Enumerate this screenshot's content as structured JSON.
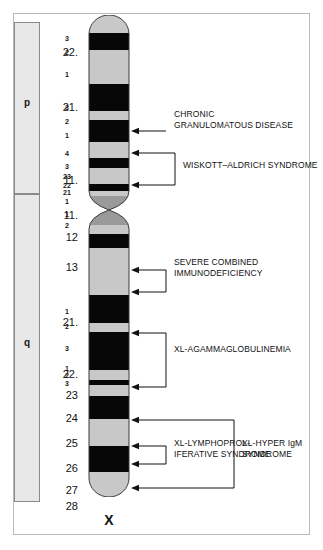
{
  "figure": {
    "chromosome_name": "X",
    "arms": [
      {
        "id": "p",
        "label": "p"
      },
      {
        "id": "q",
        "label": "q"
      }
    ]
  },
  "chart_data": {
    "type": "ideogram",
    "title": "",
    "chromosome": "X",
    "xlabel": "",
    "ylabel": "",
    "legend": [],
    "regions": [
      {
        "label": "22.",
        "arm": "p",
        "y": 53
      },
      {
        "label": "21.",
        "arm": "p",
        "y": 108
      },
      {
        "label": "11.",
        "arm": "p",
        "y": 181
      },
      {
        "label": "11.",
        "arm": "q",
        "y": 216
      },
      {
        "label": "12",
        "arm": "q",
        "y": 238
      },
      {
        "label": "13",
        "arm": "q",
        "y": 268
      },
      {
        "label": "21.",
        "arm": "q",
        "y": 323
      },
      {
        "label": "22.",
        "arm": "q",
        "y": 375
      },
      {
        "label": "23",
        "arm": "q",
        "y": 396
      },
      {
        "label": "24",
        "arm": "q",
        "y": 419
      },
      {
        "label": "25",
        "arm": "q",
        "y": 444
      },
      {
        "label": "26",
        "arm": "q",
        "y": 469
      },
      {
        "label": "27",
        "arm": "q",
        "y": 491
      },
      {
        "label": "28",
        "arm": "q",
        "y": 507
      }
    ],
    "subbands": [
      {
        "label": "3",
        "y": 39
      },
      {
        "label": "2",
        "y": 53
      },
      {
        "label": "1",
        "y": 75
      },
      {
        "label": "3",
        "y": 108
      },
      {
        "label": "2",
        "y": 122
      },
      {
        "label": "1",
        "y": 136
      },
      {
        "label": "4",
        "y": 154
      },
      {
        "label": "3",
        "y": 167
      },
      {
        "label": "23",
        "y": 177
      },
      {
        "label": "22",
        "y": 186
      },
      {
        "label": "21",
        "y": 193
      },
      {
        "label": "1",
        "y": 202
      },
      {
        "label": "1",
        "y": 215
      },
      {
        "label": "2",
        "y": 226
      },
      {
        "label": "1",
        "y": 312
      },
      {
        "label": "2",
        "y": 327
      },
      {
        "label": "3",
        "y": 349
      },
      {
        "label": "1",
        "y": 369
      },
      {
        "label": "2",
        "y": 376
      },
      {
        "label": "3",
        "y": 384
      }
    ],
    "bands": [
      {
        "id": "p22.3",
        "top": 0,
        "height": 18,
        "stain": "gneg",
        "color": "#c8c8c8"
      },
      {
        "id": "p22.2",
        "top": 18,
        "height": 17,
        "stain": "gpos",
        "color": "#070707"
      },
      {
        "id": "p22.1",
        "top": 35,
        "height": 34,
        "stain": "gneg",
        "color": "#c8c8c8"
      },
      {
        "id": "p21.3",
        "top": 69,
        "height": 27,
        "stain": "gpos",
        "color": "#070707"
      },
      {
        "id": "p21.2",
        "top": 96,
        "height": 9,
        "stain": "gneg",
        "color": "#c8c8c8"
      },
      {
        "id": "p21.1",
        "top": 105,
        "height": 22,
        "stain": "gpos",
        "color": "#070707"
      },
      {
        "id": "p11.4",
        "top": 127,
        "height": 16,
        "stain": "gneg",
        "color": "#c8c8c8"
      },
      {
        "id": "p11.3",
        "top": 143,
        "height": 10,
        "stain": "gpos",
        "color": "#070707"
      },
      {
        "id": "p11.23",
        "top": 153,
        "height": 16,
        "stain": "gneg",
        "color": "#c8c8c8"
      },
      {
        "id": "p11.22",
        "top": 169,
        "height": 7,
        "stain": "gpos",
        "color": "#070707"
      },
      {
        "id": "p11.21",
        "top": 176,
        "height": 5,
        "stain": "gneg",
        "color": "#c8c8c8"
      },
      {
        "id": "p11.1",
        "top": 181,
        "height": 14,
        "stain": "acen",
        "color": "#9a9a9a"
      },
      {
        "id": "q11.1",
        "top": 195,
        "height": 15,
        "stain": "acen",
        "color": "#9a9a9a"
      },
      {
        "id": "q11.2",
        "top": 210,
        "height": 9,
        "stain": "gneg",
        "color": "#c8c8c8"
      },
      {
        "id": "q12",
        "top": 219,
        "height": 14,
        "stain": "gpos",
        "color": "#070707"
      },
      {
        "id": "q13",
        "top": 233,
        "height": 47,
        "stain": "gneg",
        "color": "#c8c8c8"
      },
      {
        "id": "q21.1",
        "top": 280,
        "height": 28,
        "stain": "gpos",
        "color": "#070707"
      },
      {
        "id": "q21.2",
        "top": 308,
        "height": 9,
        "stain": "gneg",
        "color": "#c8c8c8"
      },
      {
        "id": "q21.3",
        "top": 317,
        "height": 38,
        "stain": "gpos",
        "color": "#070707"
      },
      {
        "id": "q22.1",
        "top": 355,
        "height": 10,
        "stain": "gneg",
        "color": "#c8c8c8"
      },
      {
        "id": "q22.2",
        "top": 365,
        "height": 5,
        "stain": "gpos",
        "color": "#070707"
      },
      {
        "id": "q22.3",
        "top": 370,
        "height": 11,
        "stain": "gneg",
        "color": "#c8c8c8"
      },
      {
        "id": "q23",
        "top": 381,
        "height": 23,
        "stain": "gpos",
        "color": "#070707"
      },
      {
        "id": "q24",
        "top": 404,
        "height": 27,
        "stain": "gneg",
        "color": "#c8c8c8"
      },
      {
        "id": "q25",
        "top": 431,
        "height": 26,
        "stain": "gpos",
        "color": "#070707"
      },
      {
        "id": "q26",
        "top": 457,
        "height": 28,
        "stain": "gneg",
        "color": "#c8c8c8"
      },
      {
        "id": "q27",
        "top": 485,
        "height": 27,
        "stain": "gpos",
        "color": "#070707"
      },
      {
        "id": "q28",
        "top": 512,
        "height": 18,
        "stain": "gneg",
        "color": "#c8c8c8"
      }
    ],
    "annotations": [
      {
        "id": "cgd",
        "text": "CHRONIC\nGRANULOMATOUS DISEASE",
        "x": 174,
        "y": 115,
        "targets": [
          131
        ]
      },
      {
        "id": "was",
        "text": "WISKOTT–ALDRICH SYNDROME",
        "x": 183,
        "y": 166,
        "targets": [
          153,
          185
        ]
      },
      {
        "id": "scid",
        "text": "SEVERE COMBINED\nIMMUNODEFICIENCY",
        "x": 174,
        "y": 263,
        "targets": [
          270,
          292
        ]
      },
      {
        "id": "xla",
        "text": "XL-AGAMMAGLOBULINEMIA",
        "x": 174,
        "y": 350,
        "targets": [
          333,
          387
        ]
      },
      {
        "id": "xlp",
        "text": "XL-LYMPHOPROL-\nIFERATIVE SYNDROME",
        "x": 174,
        "y": 444,
        "targets": [
          446,
          464
        ]
      },
      {
        "id": "xhim",
        "text": "XL-HYPER IgM\nSYNDROME",
        "x": 242,
        "y": 444,
        "targets": [
          420,
          488
        ]
      }
    ]
  },
  "colors": {
    "band_dark": "#070707",
    "band_light": "#c8c8c8",
    "band_centromere": "#9a9a9a",
    "arm_bar_fill": "#e8e8e8",
    "arm_bar_stroke": "#8a8a8a",
    "frame_stroke": "#b9b9b9",
    "leader_stroke": "#111111",
    "text": "#111111"
  }
}
